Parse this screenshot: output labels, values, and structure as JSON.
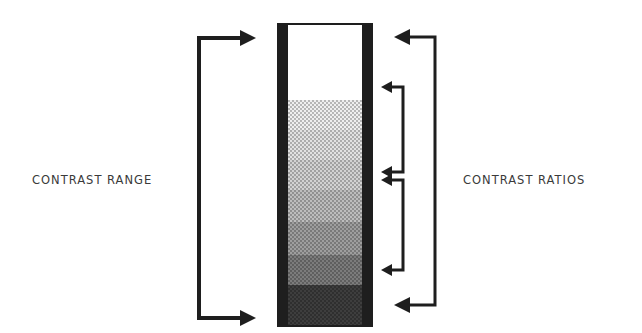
{
  "labels": {
    "left": "CONTRAST RANGE",
    "right": "CONTRAST RATIOS"
  },
  "colors": {
    "ink": "#1e1e1e",
    "text": "#3a3a3a",
    "background": "#ffffff"
  },
  "column": {
    "x": 277,
    "y": 23,
    "width": 96,
    "height": 304,
    "border": 11,
    "bands": [
      {
        "y": 25,
        "h": 75,
        "shade": "#ffffff"
      },
      {
        "y": 100,
        "h": 30,
        "shade": "#efefef"
      },
      {
        "y": 130,
        "h": 30,
        "shade": "#e2e2e2"
      },
      {
        "y": 160,
        "h": 30,
        "shade": "#d2d2d2"
      },
      {
        "y": 190,
        "h": 32,
        "shade": "#bdbdbd"
      },
      {
        "y": 222,
        "h": 33,
        "shade": "#9e9e9e"
      },
      {
        "y": 255,
        "h": 30,
        "shade": "#7c7c7c"
      },
      {
        "y": 285,
        "h": 40,
        "shade": "#3e3e3e"
      }
    ]
  },
  "brackets": {
    "range": {
      "x": 199,
      "y1": 38,
      "y2": 318,
      "tip": 256
    },
    "ratios_outer": {
      "x": 435,
      "y1": 37,
      "y2": 305,
      "tip": 394
    },
    "ratios_inner": [
      {
        "x": 403,
        "y1": 87,
        "y2": 172,
        "tip": 381
      },
      {
        "x": 403,
        "y1": 180,
        "y2": 270,
        "tip": 381
      }
    ]
  }
}
